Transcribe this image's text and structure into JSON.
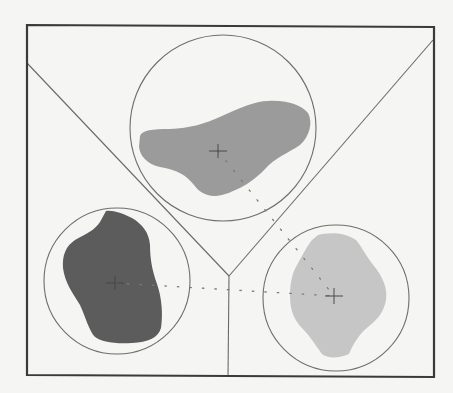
{
  "diagram": {
    "title": "",
    "background_color": "#f5f5f3",
    "frame": {
      "x1": 27,
      "y1": 25,
      "x2": 434,
      "y2": 377,
      "stroke_color": "#3a3a3a"
    },
    "dividers": [
      {
        "name": "left-diagonal",
        "from": [
          27,
          63
        ],
        "to": [
          229,
          276
        ]
      },
      {
        "name": "right-diagonal",
        "from": [
          433,
          40
        ],
        "to": [
          229,
          276
        ]
      },
      {
        "name": "vertical",
        "from": [
          229,
          276
        ],
        "to": [
          228,
          377
        ]
      }
    ],
    "junction": [
      229,
      276
    ],
    "regions": [
      {
        "id": "top",
        "circle": {
          "cx": 223,
          "cy": 128,
          "r": 93
        },
        "centroid": [
          218,
          151
        ],
        "fill_color": "#9b9b9b",
        "shade": "medium-gray"
      },
      {
        "id": "left",
        "circle": {
          "cx": 117,
          "cy": 281,
          "r": 73
        },
        "centroid": [
          115,
          283
        ],
        "fill_color": "#5c5c5c",
        "shade": "dark-gray"
      },
      {
        "id": "right",
        "circle": {
          "cx": 336,
          "cy": 298,
          "r": 73
        },
        "centroid": [
          334,
          296
        ],
        "fill_color": "#c6c6c6",
        "shade": "light-gray"
      }
    ],
    "centroid_links": [
      {
        "from": "top",
        "to": "right",
        "style": "dotted"
      },
      {
        "from": "left",
        "to": "right",
        "style": "dotted"
      }
    ]
  }
}
